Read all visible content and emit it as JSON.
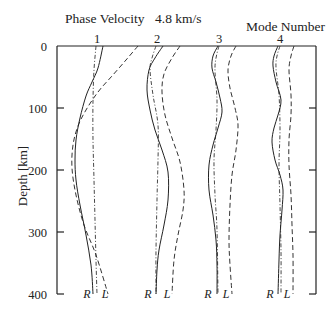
{
  "header": {
    "title_label": "Phase Velocity",
    "title_value": "4.8 km/s",
    "mode_label": "Mode Number"
  },
  "axis": {
    "ylabel": "Depth [km]",
    "yticks": [
      "0",
      "100",
      "200",
      "300",
      "400"
    ]
  },
  "chart_data": {
    "type": "line",
    "title": "Phase Velocity 4.8 km/s",
    "xlabel": "Mode Number",
    "ylabel": "Depth [km]",
    "ylim": [
      0,
      400
    ],
    "y_inverted": true,
    "grid": false,
    "categories": [
      "1",
      "2",
      "3",
      "4"
    ],
    "legend": {
      "solid": "R (radial component)",
      "dashed": "L (Love / transverse component)",
      "dashdot": "zero reference"
    },
    "series": [
      {
        "mode": "1",
        "labels": {
          "R": "R",
          "L": "L"
        },
        "depth": [
          0,
          40,
          100,
          150,
          200,
          250,
          300,
          400
        ],
        "R": [
          [
            103,
            46
          ],
          [
            98,
            68
          ],
          [
            92,
            82
          ],
          [
            86,
            96
          ],
          [
            80,
            118
          ],
          [
            76,
            140
          ],
          [
            75,
            160
          ],
          [
            76,
            180
          ],
          [
            80,
            205
          ],
          [
            86,
            235
          ],
          [
            91,
            265
          ],
          [
            93,
            294
          ]
        ],
        "L": [
          [
            138,
            46
          ],
          [
            126,
            60
          ],
          [
            112,
            76
          ],
          [
            98,
            92
          ],
          [
            86,
            110
          ],
          [
            78,
            126
          ],
          [
            73,
            145
          ],
          [
            72,
            168
          ],
          [
            76,
            195
          ],
          [
            84,
            225
          ],
          [
            96,
            255
          ],
          [
            108,
            294
          ]
        ],
        "ref": [
          [
            96,
            46
          ],
          [
            94,
            70
          ],
          [
            93,
            100
          ],
          [
            93,
            140
          ],
          [
            94,
            180
          ],
          [
            95,
            220
          ],
          [
            96,
            260
          ],
          [
            97,
            294
          ]
        ]
      },
      {
        "mode": "2",
        "labels": {
          "R": "R",
          "L": "L"
        },
        "R": [
          [
            163,
            46
          ],
          [
            155,
            58
          ],
          [
            149,
            70
          ],
          [
            147,
            90
          ],
          [
            150,
            110
          ],
          [
            155,
            130
          ],
          [
            162,
            150
          ],
          [
            168,
            172
          ],
          [
            168,
            200
          ],
          [
            164,
            225
          ],
          [
            159,
            250
          ],
          [
            157,
            270
          ],
          [
            156,
            294
          ]
        ],
        "L": [
          [
            180,
            46
          ],
          [
            172,
            58
          ],
          [
            164,
            74
          ],
          [
            162,
            92
          ],
          [
            165,
            115
          ],
          [
            172,
            138
          ],
          [
            180,
            162
          ],
          [
            184,
            190
          ],
          [
            183,
            210
          ],
          [
            178,
            235
          ],
          [
            174,
            260
          ],
          [
            172,
            294
          ]
        ],
        "ref": [
          [
            156,
            46
          ],
          [
            152,
            58
          ],
          [
            150,
            70
          ],
          [
            153,
            95
          ],
          [
            158,
            125
          ],
          [
            158,
            160
          ],
          [
            157,
            200
          ],
          [
            156,
            250
          ],
          [
            156,
            294
          ]
        ]
      },
      {
        "mode": "3",
        "labels": {
          "R": "R",
          "L": "L"
        },
        "R": [
          [
            218,
            46
          ],
          [
            213,
            56
          ],
          [
            212,
            68
          ],
          [
            216,
            82
          ],
          [
            220,
            98
          ],
          [
            222,
            112
          ],
          [
            218,
            128
          ],
          [
            213,
            145
          ],
          [
            209,
            165
          ],
          [
            209,
            190
          ],
          [
            213,
            215
          ],
          [
            216,
            240
          ],
          [
            217,
            265
          ],
          [
            217,
            294
          ]
        ],
        "L": [
          [
            236,
            46
          ],
          [
            231,
            56
          ],
          [
            228,
            70
          ],
          [
            230,
            88
          ],
          [
            235,
            108
          ],
          [
            238,
            125
          ],
          [
            236,
            150
          ],
          [
            232,
            175
          ],
          [
            230,
            205
          ],
          [
            229,
            240
          ],
          [
            230,
            265
          ],
          [
            232,
            294
          ]
        ],
        "ref": [
          [
            219,
            46
          ],
          [
            216,
            58
          ],
          [
            215,
            72
          ],
          [
            217,
            100
          ],
          [
            216,
            130
          ],
          [
            214,
            160
          ],
          [
            215,
            195
          ],
          [
            217,
            230
          ],
          [
            218,
            294
          ]
        ]
      },
      {
        "mode": "4",
        "labels": {
          "R": "R",
          "L": "L"
        },
        "R": [
          [
            278,
            46
          ],
          [
            274,
            56
          ],
          [
            273,
            66
          ],
          [
            276,
            82
          ],
          [
            281,
            100
          ],
          [
            278,
            115
          ],
          [
            274,
            128
          ],
          [
            272,
            142
          ],
          [
            275,
            160
          ],
          [
            280,
            175
          ],
          [
            283,
            190
          ],
          [
            282,
            210
          ],
          [
            280,
            235
          ],
          [
            279,
            260
          ],
          [
            278,
            294
          ]
        ],
        "L": [
          [
            294,
            46
          ],
          [
            291,
            56
          ],
          [
            289,
            70
          ],
          [
            291,
            95
          ],
          [
            291,
            115
          ],
          [
            289,
            140
          ],
          [
            289,
            165
          ],
          [
            291,
            195
          ],
          [
            292,
            225
          ],
          [
            293,
            255
          ],
          [
            293,
            294
          ]
        ],
        "ref": [
          [
            280,
            46
          ],
          [
            277,
            56
          ],
          [
            276,
            68
          ],
          [
            279,
            95
          ],
          [
            280,
            130
          ],
          [
            279,
            165
          ],
          [
            280,
            205
          ],
          [
            281,
            250
          ],
          [
            281,
            294
          ]
        ]
      }
    ]
  },
  "layout": {
    "plot": {
      "left": 57,
      "right": 316,
      "top": 46,
      "bottom": 294
    },
    "mode_label_x": [
      97,
      157,
      219,
      280
    ],
    "R_label_x": [
      87,
      148,
      208,
      270
    ],
    "L_label_x": [
      105,
      167,
      226,
      287
    ],
    "colors": {
      "line": "#222222",
      "axis": "#222222"
    }
  }
}
